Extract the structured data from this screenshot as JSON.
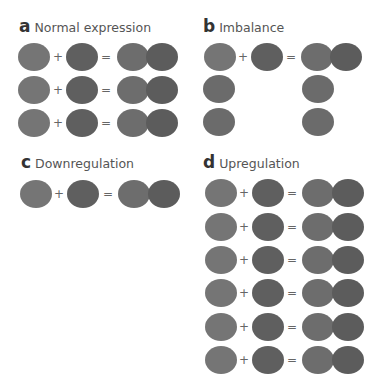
{
  "figure": {
    "symbols": {
      "plus": "+",
      "equals": "="
    },
    "colors": {
      "subunit_a": "#757575",
      "subunit_b": "#5f5f5f",
      "complex_a": "#6d6d6d",
      "complex_b": "#5c5c5c",
      "unpaired": "#6b6b6b",
      "background": "#ffffff"
    },
    "panels": [
      {
        "letter": "a",
        "title": "Normal expression",
        "rows": [
          {
            "left": "A",
            "plus": true,
            "right": "B",
            "equals": true,
            "result": "AB"
          },
          {
            "left": "A",
            "plus": true,
            "right": "B",
            "equals": true,
            "result": "AB"
          },
          {
            "left": "A",
            "plus": true,
            "right": "B",
            "equals": true,
            "result": "AB"
          }
        ]
      },
      {
        "letter": "b",
        "title": "Imbalance",
        "rows": [
          {
            "left": "A",
            "plus": true,
            "right": "B",
            "equals": true,
            "result": "AB"
          },
          {
            "left": "A",
            "plus": false,
            "right": null,
            "equals": false,
            "result": "A"
          },
          {
            "left": "A",
            "plus": false,
            "right": null,
            "equals": false,
            "result": "A"
          }
        ]
      },
      {
        "letter": "c",
        "title": "Downregulation",
        "rows": [
          {
            "left": "A",
            "plus": true,
            "right": "B",
            "equals": true,
            "result": "AB"
          }
        ]
      },
      {
        "letter": "d",
        "title": "Upregulation",
        "rows": [
          {
            "left": "A",
            "plus": true,
            "right": "B",
            "equals": true,
            "result": "AB"
          },
          {
            "left": "A",
            "plus": true,
            "right": "B",
            "equals": true,
            "result": "AB"
          },
          {
            "left": "A",
            "plus": true,
            "right": "B",
            "equals": true,
            "result": "AB"
          },
          {
            "left": "A",
            "plus": true,
            "right": "B",
            "equals": true,
            "result": "AB"
          },
          {
            "left": "A",
            "plus": true,
            "right": "B",
            "equals": true,
            "result": "AB"
          },
          {
            "left": "A",
            "plus": true,
            "right": "B",
            "equals": true,
            "result": "AB"
          }
        ]
      }
    ]
  }
}
